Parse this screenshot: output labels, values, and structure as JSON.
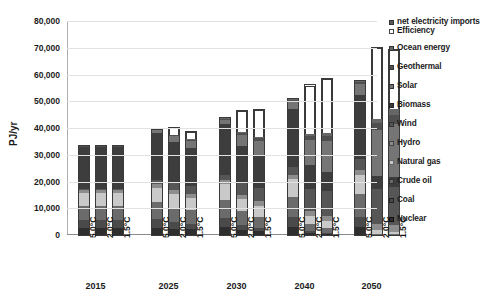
{
  "chart_data": {
    "type": "bar",
    "title": "",
    "xlabel": "",
    "ylabel": "PJ/yr",
    "ylim": [
      0,
      80000
    ],
    "ytick_labels": [
      "80,000",
      "70,000",
      "60,000",
      "50,000",
      "40,000",
      "30,000",
      "20,000",
      "10,000",
      "0"
    ],
    "ytick_values": [
      80000,
      70000,
      60000,
      50000,
      40000,
      30000,
      20000,
      10000,
      0
    ],
    "grid": true,
    "legend_position": "right",
    "stacked": true,
    "group_labels": [
      "2015",
      "2025",
      "2030",
      "2040",
      "2050"
    ],
    "scenario_labels": [
      "5.0°C",
      "2.0°C",
      "1.5°C"
    ],
    "categories": [
      "2015 5.0°C",
      "2015 2.0°C",
      "2015 1.5°C",
      "2025 5.0°C",
      "2025 2.0°C",
      "2025 1.5°C",
      "2030 5.0°C",
      "2030 2.0°C",
      "2030 1.5°C",
      "2040 5.0°C",
      "2040 2.0°C",
      "2040 1.5°C",
      "2050 5.0°C",
      "2050 2.0°C",
      "2050 1.5°C"
    ],
    "series": [
      {
        "name": "Nuclear",
        "color": "#2e2e2e",
        "values": [
          2600,
          2600,
          2600,
          2800,
          2400,
          2200,
          2900,
          2000,
          1500,
          3000,
          700,
          500,
          3100,
          0,
          0
        ]
      },
      {
        "name": "Coal",
        "color": "#4a4a4a",
        "values": [
          3000,
          3000,
          3000,
          3200,
          2400,
          2000,
          3400,
          1800,
          1200,
          3600,
          700,
          400,
          3800,
          0,
          0
        ]
      },
      {
        "name": "Crude oil",
        "color": "#6b6b6b",
        "values": [
          5400,
          5400,
          5400,
          6200,
          5400,
          5000,
          6800,
          5000,
          4200,
          7600,
          2600,
          1800,
          8300,
          500,
          300
        ]
      },
      {
        "name": "Natural gas",
        "color": "#c9c9c9",
        "values": [
          4600,
          4600,
          4600,
          5400,
          5000,
          4600,
          5800,
          4600,
          4000,
          6600,
          3000,
          2400,
          7400,
          1200,
          700
        ]
      },
      {
        "name": "Hydro",
        "color": "#8d8d8d",
        "values": [
          1200,
          1200,
          1200,
          1400,
          1500,
          1600,
          1500,
          1700,
          1800,
          1700,
          2100,
          2200,
          1900,
          2500,
          2600
        ]
      },
      {
        "name": "Wind",
        "color": "#565656",
        "values": [
          500,
          500,
          500,
          1400,
          2600,
          3000,
          1900,
          4200,
          5000,
          2800,
          8000,
          9200,
          3800,
          13000,
          14500
        ]
      },
      {
        "name": "Biomass",
        "color": "#3d3d3d",
        "values": [
          15600,
          15600,
          15600,
          17800,
          15500,
          14000,
          19400,
          14000,
          12000,
          22000,
          9000,
          7000,
          24000,
          5000,
          3500
        ]
      },
      {
        "name": "Solar",
        "color": "#757575",
        "values": [
          200,
          200,
          200,
          900,
          2200,
          2600,
          1400,
          4200,
          5400,
          2600,
          9500,
          11500,
          4000,
          17000,
          20000
        ]
      },
      {
        "name": "Geothermal",
        "color": "#4f4f4f",
        "values": [
          100,
          100,
          100,
          300,
          500,
          600,
          400,
          800,
          1000,
          700,
          1500,
          1900,
          1000,
          2600,
          3200
        ]
      },
      {
        "name": "Ocean energy",
        "color": "#666666",
        "values": [
          0,
          0,
          0,
          0,
          100,
          200,
          100,
          300,
          400,
          200,
          800,
          1100,
          300,
          1700,
          2200
        ]
      },
      {
        "name": "Efficiency",
        "color": "#ffffff",
        "values": [
          0,
          0,
          0,
          0,
          2300,
          2600,
          0,
          7600,
          10200,
          0,
          18000,
          20200,
          0,
          26500,
          22000
        ]
      },
      {
        "name": "net electricity imports",
        "color": "#595959",
        "values": [
          0,
          0,
          0,
          0,
          0,
          0,
          0,
          0,
          0,
          0,
          0,
          0,
          0,
          0,
          0
        ]
      }
    ],
    "totals": [
      33200,
      33200,
      33200,
      39400,
      39900,
      38400,
      43600,
      46200,
      46700,
      50800,
      55900,
      58200,
      57600,
      70000,
      68500
    ]
  },
  "legend": {
    "items": [
      {
        "label": "net electricity imports",
        "color": "#595959",
        "border": "#333333"
      },
      {
        "label": "Efficiency",
        "color": "#ffffff",
        "border": "#444444"
      },
      {
        "label": "Ocean energy",
        "color": "#666666",
        "border": "#333333"
      },
      {
        "label": "Geothermal",
        "color": "#4f4f4f",
        "border": "#333333"
      },
      {
        "label": "Solar",
        "color": "#757575",
        "border": "#333333"
      },
      {
        "label": "Biomass",
        "color": "#3d3d3d",
        "border": "#222222"
      },
      {
        "label": "Wind",
        "color": "#565656",
        "border": "#333333"
      },
      {
        "label": "Hydro",
        "color": "#8d8d8d",
        "border": "#444444"
      },
      {
        "label": "Natural gas",
        "color": "#c9c9c9",
        "border": "#666666"
      },
      {
        "label": "Crude oil",
        "color": "#6b6b6b",
        "border": "#333333"
      },
      {
        "label": "Coal",
        "color": "#4a4a4a",
        "border": "#222222"
      },
      {
        "label": "Nuclear",
        "color": "#2e2e2e",
        "border": "#111111"
      }
    ]
  }
}
